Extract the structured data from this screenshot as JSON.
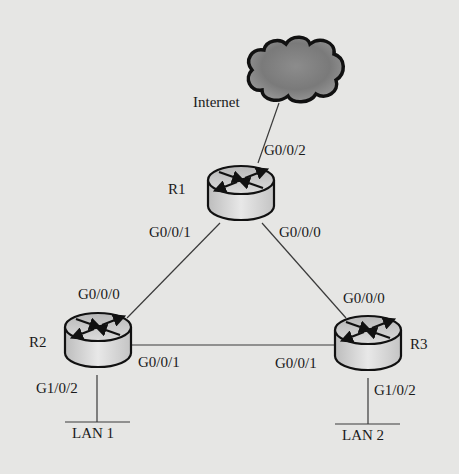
{
  "diagram": {
    "type": "network-topology",
    "cloud": {
      "label": "Internet"
    },
    "routers": [
      {
        "id": "R1",
        "label": "R1"
      },
      {
        "id": "R2",
        "label": "R2"
      },
      {
        "id": "R3",
        "label": "R3"
      }
    ],
    "interfaces": {
      "r1_g002": "G0/0/2",
      "r1_g001": "G0/0/1",
      "r1_g000": "G0/0/0",
      "r2_g000": "G0/0/0",
      "r2_g001": "G0/0/1",
      "r2_g102": "G1/0/2",
      "r3_g000": "G0/0/0",
      "r3_g001": "G0/0/1",
      "r3_g102": "G1/0/2"
    },
    "lans": [
      {
        "id": "LAN1",
        "label": "LAN 1"
      },
      {
        "id": "LAN2",
        "label": "LAN 2"
      }
    ],
    "links": [
      {
        "from": "Internet",
        "to": "R1:G0/0/2"
      },
      {
        "from": "R1:G0/0/1",
        "to": "R2:G0/0/0"
      },
      {
        "from": "R1:G0/0/0",
        "to": "R3:G0/0/0"
      },
      {
        "from": "R2:G0/0/1",
        "to": "R3:G0/0/1"
      },
      {
        "from": "R2:G1/0/2",
        "to": "LAN 1"
      },
      {
        "from": "R3:G1/0/2",
        "to": "LAN 2"
      }
    ]
  }
}
